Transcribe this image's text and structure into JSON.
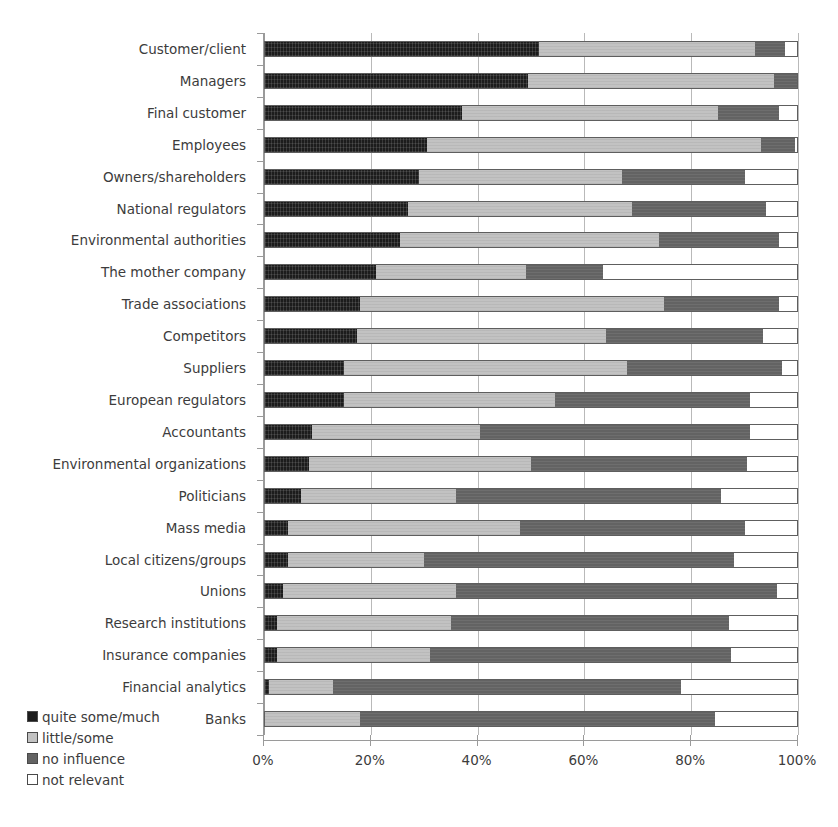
{
  "chart_data": {
    "type": "bar",
    "subtype": "stacked-horizontal-100pct",
    "title": "",
    "xlabel": "",
    "ylabel": "",
    "xlim": [
      0,
      100
    ],
    "xticks": [
      "0%",
      "20%",
      "40%",
      "60%",
      "80%",
      "100%"
    ],
    "xtick_values": [
      0,
      20,
      40,
      60,
      80,
      100
    ],
    "grid": "vertical",
    "legend_position": "bottom-left",
    "categories": [
      "Customer/client",
      "Managers",
      "Final customer",
      "Employees",
      "Owners/shareholders",
      "National regulators",
      "Environmental authorities",
      "The mother company",
      "Trade associations",
      "Competitors",
      "Suppliers",
      "European regulators",
      "Accountants",
      "Environmental organizations",
      "Politicians",
      "Mass media",
      "Local citizens/groups",
      "Unions",
      "Research institutions",
      "Insurance companies",
      "Financial analytics",
      "Banks"
    ],
    "series": [
      {
        "name": "quite some/much",
        "color": "#1c1c1c",
        "values": [
          51.5,
          49.5,
          37.0,
          30.5,
          29.0,
          27.0,
          25.5,
          21.0,
          18.0,
          17.5,
          15.0,
          15.0,
          9.0,
          8.5,
          7.0,
          4.5,
          4.5,
          3.5,
          2.5,
          2.5,
          1.0,
          0.0
        ]
      },
      {
        "name": "little/some",
        "color": "#c2c2c2",
        "values": [
          40.5,
          46.0,
          48.0,
          62.5,
          38.0,
          42.0,
          48.5,
          28.0,
          57.0,
          46.5,
          53.0,
          39.5,
          31.5,
          41.5,
          29.0,
          43.5,
          25.5,
          32.5,
          32.5,
          28.5,
          12.0,
          18.0
        ]
      },
      {
        "name": "no influence",
        "color": "#636363",
        "values": [
          5.5,
          4.5,
          11.5,
          6.5,
          23.0,
          25.0,
          22.5,
          14.5,
          21.5,
          29.5,
          29.0,
          36.5,
          50.5,
          40.5,
          49.5,
          42.0,
          58.0,
          60.0,
          52.0,
          56.5,
          65.0,
          66.5
        ]
      },
      {
        "name": "not relevant",
        "color": "#ffffff",
        "values": [
          2.5,
          0.0,
          3.5,
          0.5,
          10.0,
          6.0,
          3.5,
          36.5,
          3.5,
          6.5,
          3.0,
          9.0,
          9.0,
          9.5,
          14.5,
          10.0,
          12.0,
          4.0,
          13.0,
          12.5,
          22.0,
          15.5
        ]
      }
    ]
  },
  "legend": {
    "items": [
      {
        "label": "quite some/much",
        "color": "#1c1c1c"
      },
      {
        "label": "little/some",
        "color": "#c2c2c2"
      },
      {
        "label": "no influence",
        "color": "#636363"
      },
      {
        "label": "not relevant",
        "color": "#ffffff"
      }
    ]
  }
}
